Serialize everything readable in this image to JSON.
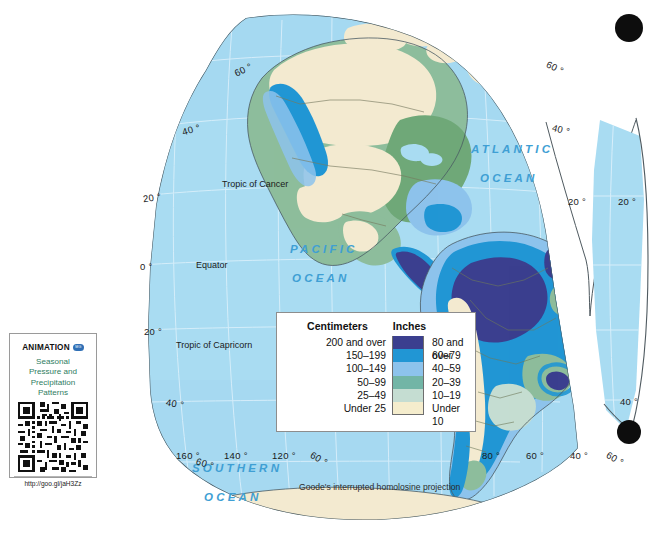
{
  "map": {
    "projection_note": "Goode's interrupted homolosine projection",
    "ocean_labels": [
      {
        "name": "ATLANTIC",
        "line2": "OCEAN",
        "x": 471,
        "y": 143
      },
      {
        "name": "PACIFIC",
        "line2": "OCEAN",
        "x": 290,
        "y": 243
      },
      {
        "name": "SOUTHERN",
        "line2": "OCEAN",
        "x": 192,
        "y": 462
      }
    ],
    "special_lines": [
      {
        "label": "Tropic of Cancer",
        "x": 222,
        "y": 183
      },
      {
        "label": "Equator",
        "x": 196,
        "y": 263
      },
      {
        "label": "Tropic of Capricorn",
        "x": 176,
        "y": 344
      }
    ],
    "latitude_labels": [
      {
        "text": "60 °",
        "x": 234,
        "y": 69
      },
      {
        "text": "40 °",
        "x": 182,
        "y": 128
      },
      {
        "text": "20 °",
        "x": 143,
        "y": 196
      },
      {
        "text": "0 °",
        "x": 140,
        "y": 265
      },
      {
        "text": "20 °",
        "x": 144,
        "y": 330
      },
      {
        "text": "40 °",
        "x": 166,
        "y": 402
      },
      {
        "text": "60 °",
        "x": 196,
        "y": 462
      },
      {
        "text": "60 °",
        "x": 546,
        "y": 66
      },
      {
        "text": "40 °",
        "x": 552,
        "y": 128
      },
      {
        "text": "20 °",
        "x": 570,
        "y": 200
      },
      {
        "text": "20 °",
        "x": 620,
        "y": 200
      },
      {
        "text": "40 °",
        "x": 624,
        "y": 400
      }
    ],
    "longitude_labels": [
      {
        "text": "160 °",
        "x": 176,
        "y": 455
      },
      {
        "text": "140 °",
        "x": 224,
        "y": 455
      },
      {
        "text": "120 °",
        "x": 273,
        "y": 455
      },
      {
        "text": "60 °",
        "x": 313,
        "y": 458
      },
      {
        "text": "80 °",
        "x": 484,
        "y": 455
      },
      {
        "text": "60 °",
        "x": 528,
        "y": 455
      },
      {
        "text": "40 °",
        "x": 572,
        "y": 455
      },
      {
        "text": "60 °",
        "x": 609,
        "y": 458
      }
    ],
    "colors": {
      "ocean": "#a9dcf2",
      "ocean_deep": "#9ed4ee",
      "graticule": "#cfeaf7",
      "coast_outline": "#3a4a55",
      "country_border": "#6b6f58",
      "page_background": "#ffffff"
    }
  },
  "legend": {
    "heading_left": "Centimeters",
    "heading_right": "Inches",
    "rows": [
      {
        "cm": "200 and over",
        "inches": "80 and over",
        "color": "#3b3f8f"
      },
      {
        "cm": "150–199",
        "inches": "60–79",
        "color": "#2196d4"
      },
      {
        "cm": "100–149",
        "inches": "40–59",
        "color": "#8dc3ec"
      },
      {
        "cm": "50–99",
        "inches": "20–39",
        "color": "#72b5a6"
      },
      {
        "cm": "25–49",
        "inches": "10–19",
        "color": "#c5ddd2"
      },
      {
        "cm": "Under 25",
        "inches": "Under 10",
        "color": "#f5edcd"
      }
    ]
  },
  "animation_box": {
    "title": "ANIMATION",
    "badge": "MG",
    "subtitle_lines": [
      "Seasonal",
      "Pressure and",
      "Precipitation",
      "Patterns"
    ],
    "qr_alt": "qr-code",
    "url": "http://goo.gl/jaH3Zz"
  },
  "marks": {
    "corner_dots": [
      {
        "name": "top-right-dot",
        "x": 629,
        "y": 28,
        "r": 14
      },
      {
        "name": "bottom-right-dot",
        "x": 629,
        "y": 432,
        "r": 12
      }
    ]
  }
}
